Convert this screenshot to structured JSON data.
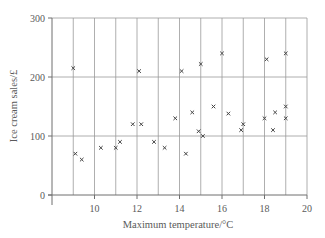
{
  "chart_data": {
    "type": "scatter",
    "title": "",
    "xlabel": "Maximum temperature/°C",
    "ylabel": "Ice cream sales/£",
    "xlim": [
      8,
      20
    ],
    "ylim": [
      0,
      300
    ],
    "xticks": [
      10,
      12,
      14,
      16,
      18,
      20
    ],
    "yticks": [
      0,
      100,
      200,
      300
    ],
    "vertical_gridlines": [
      9,
      10,
      11,
      12,
      13,
      14,
      15,
      16,
      17,
      18,
      19,
      20
    ],
    "horizontal_gridlines": [
      100,
      200,
      300
    ],
    "grid": true,
    "legend": null,
    "marker": "x",
    "series": [
      {
        "name": "Ice cream sales",
        "points": [
          {
            "x": 9.0,
            "y": 215
          },
          {
            "x": 9.1,
            "y": 70
          },
          {
            "x": 9.4,
            "y": 60
          },
          {
            "x": 10.3,
            "y": 80
          },
          {
            "x": 11.0,
            "y": 80
          },
          {
            "x": 11.2,
            "y": 90
          },
          {
            "x": 11.8,
            "y": 120
          },
          {
            "x": 12.1,
            "y": 210
          },
          {
            "x": 12.2,
            "y": 120
          },
          {
            "x": 12.8,
            "y": 90
          },
          {
            "x": 13.3,
            "y": 80
          },
          {
            "x": 13.8,
            "y": 130
          },
          {
            "x": 14.1,
            "y": 210
          },
          {
            "x": 14.3,
            "y": 70
          },
          {
            "x": 14.6,
            "y": 140
          },
          {
            "x": 14.9,
            "y": 108
          },
          {
            "x": 15.0,
            "y": 222
          },
          {
            "x": 15.1,
            "y": 100
          },
          {
            "x": 15.6,
            "y": 150
          },
          {
            "x": 16.0,
            "y": 240
          },
          {
            "x": 16.3,
            "y": 138
          },
          {
            "x": 16.9,
            "y": 110
          },
          {
            "x": 17.0,
            "y": 120
          },
          {
            "x": 18.0,
            "y": 130
          },
          {
            "x": 18.1,
            "y": 230
          },
          {
            "x": 18.4,
            "y": 110
          },
          {
            "x": 18.5,
            "y": 140
          },
          {
            "x": 19.0,
            "y": 240
          },
          {
            "x": 19.0,
            "y": 150
          },
          {
            "x": 19.0,
            "y": 130
          }
        ]
      }
    ]
  },
  "colors": {
    "axis": "#6e6e6e",
    "grid": "#9a9a9a",
    "marker": "#444444",
    "text": "#5a5a5a"
  }
}
